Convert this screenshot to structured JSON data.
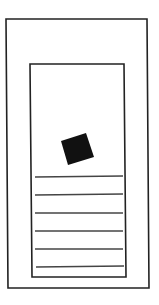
{
  "canvas": {
    "width": 159,
    "height": 305,
    "background": "#ffffff"
  },
  "colors": {
    "stroke": "#222222",
    "fill": "#111111",
    "line": "#444444"
  },
  "diagram": {
    "outer_frame": {
      "points": "6,19 147,19 149,288 8,288"
    },
    "inner_frame": {
      "points": "30,64 124,64 126,277 32,277"
    },
    "image_block": {
      "points": "61,141 86,133 94,157 68,165"
    },
    "text_lines": [
      {
        "x1": 35,
        "y1": 177,
        "x2": 123,
        "y2": 176
      },
      {
        "x1": 35,
        "y1": 195,
        "x2": 123,
        "y2": 194
      },
      {
        "x1": 35,
        "y1": 213,
        "x2": 123,
        "y2": 213
      },
      {
        "x1": 35,
        "y1": 231,
        "x2": 123,
        "y2": 231
      },
      {
        "x1": 35,
        "y1": 249,
        "x2": 123,
        "y2": 249
      },
      {
        "x1": 36,
        "y1": 267,
        "x2": 124,
        "y2": 266
      }
    ]
  }
}
